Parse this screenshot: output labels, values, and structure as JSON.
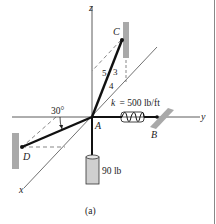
{
  "figure": {
    "caption": "(a)",
    "axes": {
      "z": "z",
      "y": "y",
      "x": "x"
    },
    "points": {
      "A": "A",
      "B": "B",
      "C": "C",
      "D": "D"
    },
    "slope": {
      "hyp": "5",
      "rise": "3",
      "run": "4"
    },
    "angle": "30°",
    "spring": {
      "k_label": "k",
      "k_value": "= 500 lb/ft"
    },
    "weight": "90 lb"
  }
}
